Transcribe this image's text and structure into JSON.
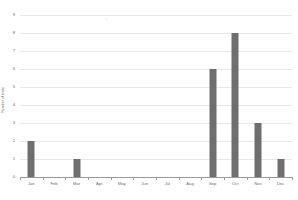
{
  "chart_data": {
    "type": "bar",
    "title": "",
    "xlabel": "",
    "ylabel": "Number of birds",
    "categories": [
      "Jan",
      "Feb",
      "Mar",
      "Apr",
      "May",
      "Jun",
      "Jul",
      "Aug",
      "Sep",
      "Oct",
      "Nov",
      "Dec"
    ],
    "values": [
      2,
      0,
      1,
      0,
      0,
      0,
      0,
      0,
      6,
      8,
      3,
      1
    ],
    "ylim": [
      0,
      9
    ],
    "y_ticks": [
      0,
      1,
      2,
      3,
      4,
      5,
      6,
      7,
      8,
      9
    ],
    "y_tick_labels": [
      "0",
      "1",
      "2",
      "3",
      "4",
      "5",
      "6",
      "7",
      "8",
      "9"
    ],
    "grid": true,
    "legend": false,
    "bar_color": "#6e6e6e",
    "gridline_color": "#e8e8e8",
    "axis_color": "#9a9a9a",
    "background_color": "#ffffff"
  }
}
